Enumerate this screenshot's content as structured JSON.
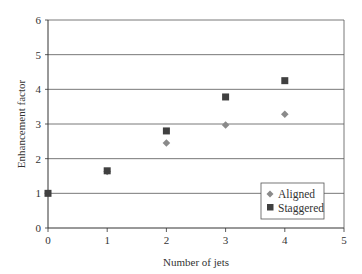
{
  "chart_data": {
    "type": "scatter",
    "title": "",
    "xlabel": "Number of jets",
    "ylabel": "Enhancement factor",
    "xlim": [
      0,
      5
    ],
    "ylim": [
      0,
      6
    ],
    "xticks": [
      0,
      1,
      2,
      3,
      4,
      5
    ],
    "yticks": [
      0,
      1,
      2,
      3,
      4,
      5,
      6
    ],
    "grid": {
      "horizontal": true,
      "vertical": false
    },
    "legend_position": "lower right (inside plot)",
    "series": [
      {
        "name": "Aligned",
        "marker": "diamond",
        "color": "#8a8a8a",
        "x": [
          0,
          1,
          2,
          3,
          4
        ],
        "y": [
          1.0,
          1.63,
          2.45,
          2.97,
          3.28
        ]
      },
      {
        "name": "Staggered",
        "marker": "square",
        "color": "#404040",
        "x": [
          0,
          1,
          2,
          3,
          4
        ],
        "y": [
          1.0,
          1.65,
          2.8,
          3.78,
          4.25
        ]
      }
    ]
  },
  "legend": {
    "items": [
      {
        "label": "Aligned",
        "marker": "diamond",
        "color": "#8a8a8a"
      },
      {
        "label": "Staggered",
        "marker": "square",
        "color": "#404040"
      }
    ]
  },
  "axes": {
    "x_title": "Number of jets",
    "y_title": "Enhancement factor"
  }
}
